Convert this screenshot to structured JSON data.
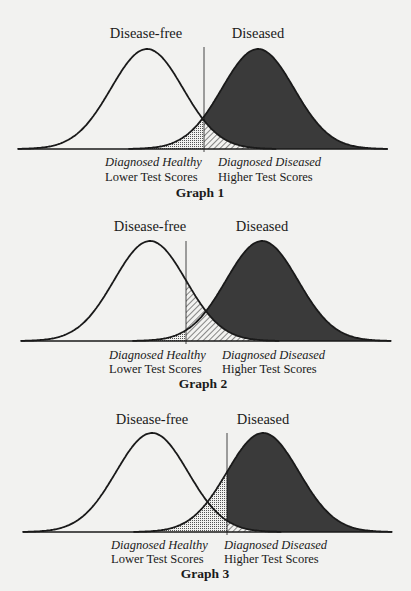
{
  "figure": {
    "colors": {
      "background": "#f2f2f0",
      "ink": "#1a1a1a",
      "diseased_fill": "#3a3a3a",
      "hatch": "#2a2a2a",
      "dots": "#555555"
    }
  },
  "graphs": [
    {
      "caption": "Graph 1",
      "group_labels": {
        "left": "Disease-free",
        "right": "Diseased"
      },
      "axis_labels": {
        "left_italic": "Diagnosed Healthy",
        "left": "Lower Test Scores",
        "right_italic": "Diagnosed Diseased",
        "right": "Higher Test Scores"
      },
      "layout": {
        "baseline_y": 149,
        "axis_x0": 18,
        "axis_x1": 388,
        "left_mean_x": 147,
        "right_mean_x": 258,
        "sigma_px": 36,
        "peak_h": 100,
        "cutoff_x": 204,
        "cutoff_top_y": 47,
        "group_label_y": 26,
        "left_group_x": 146,
        "right_group_x": 258,
        "diag_y": 156,
        "scores_y": 171,
        "caption_y": 186,
        "left_text_x": 105,
        "right_text_x": 218,
        "caption_x": 200
      }
    },
    {
      "caption": "Graph 2",
      "group_labels": {
        "left": "Disease-free",
        "right": "Diseased"
      },
      "axis_labels": {
        "left_italic": "Diagnosed Healthy",
        "left": "Lower Test Scores",
        "right_italic": "Diagnosed Diseased",
        "right": "Higher Test Scores"
      },
      "layout": {
        "baseline_y": 341,
        "axis_x0": 21,
        "axis_x1": 391,
        "left_mean_x": 150,
        "right_mean_x": 262,
        "sigma_px": 36,
        "peak_h": 100,
        "cutoff_x": 186,
        "cutoff_top_y": 241,
        "group_label_y": 219,
        "left_group_x": 150,
        "right_group_x": 262,
        "diag_y": 349,
        "scores_y": 363,
        "caption_y": 377,
        "left_text_x": 109,
        "right_text_x": 222,
        "caption_x": 203
      }
    },
    {
      "caption": "Graph 3",
      "group_labels": {
        "left": "Disease-free",
        "right": "Diseased"
      },
      "axis_labels": {
        "left_italic": "Diagnosed Healthy",
        "left": "Lower Test Scores",
        "right_italic": "Diagnosed Diseased",
        "right": "Higher Test Scores"
      },
      "layout": {
        "baseline_y": 532,
        "axis_x0": 23,
        "axis_x1": 392,
        "left_mean_x": 152,
        "right_mean_x": 263,
        "sigma_px": 36,
        "peak_h": 99,
        "cutoff_x": 227,
        "cutoff_top_y": 433,
        "group_label_y": 412,
        "left_group_x": 152,
        "right_group_x": 263,
        "diag_y": 539,
        "scores_y": 553,
        "caption_y": 567,
        "left_text_x": 111,
        "right_text_x": 224,
        "caption_x": 205
      }
    }
  ],
  "chart_data": [
    {
      "type": "area",
      "title": "Graph 1",
      "xlabel": "Test Score (Lower → Higher)",
      "ylabel": "",
      "series": [
        {
          "name": "Disease-free",
          "distribution": "normal",
          "mean": 0,
          "sd": 1
        },
        {
          "name": "Diseased",
          "distribution": "normal",
          "mean": 3.1,
          "sd": 1
        }
      ],
      "cutoff": 1.58,
      "regions": {
        "dotted": "Diseased below cutoff (false negatives)",
        "hatched": "Disease-free above cutoff (false positives)",
        "dark": "Diseased above cutoff (true positives)"
      },
      "annotations": [
        "Diagnosed Healthy / Lower Test Scores",
        "Diagnosed Diseased / Higher Test Scores"
      ],
      "grid": false
    },
    {
      "type": "area",
      "title": "Graph 2",
      "xlabel": "Test Score (Lower → Higher)",
      "ylabel": "",
      "series": [
        {
          "name": "Disease-free",
          "distribution": "normal",
          "mean": 0,
          "sd": 1
        },
        {
          "name": "Diseased",
          "distribution": "normal",
          "mean": 3.1,
          "sd": 1
        }
      ],
      "cutoff": 1.0,
      "regions": {
        "dotted": "Diseased below cutoff (false negatives)",
        "hatched": "Disease-free above cutoff (false positives)",
        "dark": "Diseased above cutoff (true positives)"
      },
      "annotations": [
        "Diagnosed Healthy / Lower Test Scores",
        "Diagnosed Diseased / Higher Test Scores"
      ],
      "grid": false
    },
    {
      "type": "area",
      "title": "Graph 3",
      "xlabel": "Test Score (Lower → Higher)",
      "ylabel": "",
      "series": [
        {
          "name": "Disease-free",
          "distribution": "normal",
          "mean": 0,
          "sd": 1
        },
        {
          "name": "Diseased",
          "distribution": "normal",
          "mean": 3.1,
          "sd": 1
        }
      ],
      "cutoff": 2.08,
      "regions": {
        "dotted": "Diseased below cutoff (false negatives)",
        "hatched": "Disease-free above cutoff (false positives)",
        "dark": "Diseased above cutoff (true positives)"
      },
      "annotations": [
        "Diagnosed Healthy / Lower Test Scores",
        "Diagnosed Diseased / Higher Test Scores"
      ],
      "grid": false
    }
  ]
}
